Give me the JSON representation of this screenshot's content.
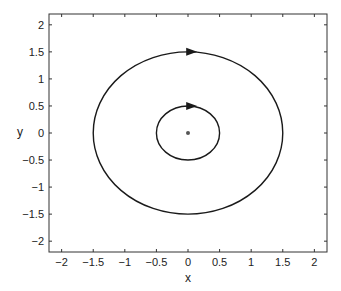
{
  "chart_data": {
    "type": "line",
    "title": "",
    "xlabel": "x",
    "ylabel": "y",
    "xlim": [
      -2.2,
      2.2
    ],
    "ylim": [
      -2.2,
      2.2
    ],
    "xticks": [
      -2,
      -1.5,
      -1,
      -0.5,
      0,
      0.5,
      1,
      1.5,
      2
    ],
    "xtick_labels": [
      "−2",
      "−1.5",
      "−1",
      "−0.5",
      "0",
      "0.5",
      "1",
      "1.5",
      "2"
    ],
    "yticks": [
      2,
      1.5,
      1,
      0.5,
      0,
      -0.5,
      -1,
      -1.5,
      -2
    ],
    "ytick_labels": [
      "2",
      "1.5",
      "1",
      "0.5",
      "0",
      "−0.5",
      "−1",
      "−1.5",
      "−2"
    ],
    "grid": false,
    "legend": null,
    "series": [
      {
        "name": "outer orbit",
        "shape": "circle",
        "center": [
          0,
          0
        ],
        "radius": 1.5,
        "direction": "clockwise",
        "arrow_at": [
          0.05,
          1.5
        ]
      },
      {
        "name": "inner orbit",
        "shape": "circle",
        "center": [
          0,
          0
        ],
        "radius": 0.5,
        "direction": "clockwise",
        "arrow_at": [
          0.05,
          0.5
        ]
      },
      {
        "name": "equilibrium point",
        "shape": "point",
        "x": 0,
        "y": 0
      }
    ]
  },
  "colors": {
    "line": "#1a1a1a",
    "axes": "#333333",
    "background": "#ffffff"
  }
}
